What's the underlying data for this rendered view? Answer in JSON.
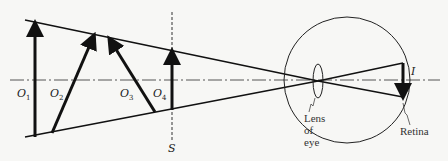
{
  "diagram": {
    "colors": {
      "background": "#f7f7f5",
      "ink": "#111111",
      "axis": "#555555"
    },
    "objects": [
      {
        "id": "O1",
        "letter": "O",
        "subscript": "1"
      },
      {
        "id": "O2",
        "letter": "O",
        "subscript": "2"
      },
      {
        "id": "O3",
        "letter": "O",
        "subscript": "3"
      },
      {
        "id": "O4",
        "letter": "O",
        "subscript": "4"
      }
    ],
    "screen_label": "S",
    "image_label": "I",
    "lens_label": [
      "Lens",
      "of",
      "eye"
    ],
    "retina_label": "Retina"
  }
}
